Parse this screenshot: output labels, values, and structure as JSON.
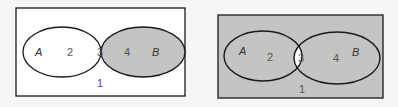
{
  "colors": {
    "background": "#f6f6f4",
    "shade": "#c4c4c2",
    "unshaded": "#ffffff",
    "stroke": "#1a1a1a",
    "region_label": "#555555"
  },
  "diagrams": [
    {
      "name": "venn-b-minus-a",
      "shaded_regions": [
        "4"
      ],
      "labels": {
        "set_a": "A",
        "set_b": "B",
        "region_1": "1",
        "region_2": "2",
        "region_3": "3",
        "region_4": "4"
      }
    },
    {
      "name": "venn-complement-of-intersection",
      "shaded_regions": [
        "1",
        "2",
        "4"
      ],
      "labels": {
        "set_a": "A",
        "set_b": "B",
        "region_1": "1",
        "region_2": "2",
        "region_3": "3",
        "region_4": "4"
      }
    }
  ]
}
